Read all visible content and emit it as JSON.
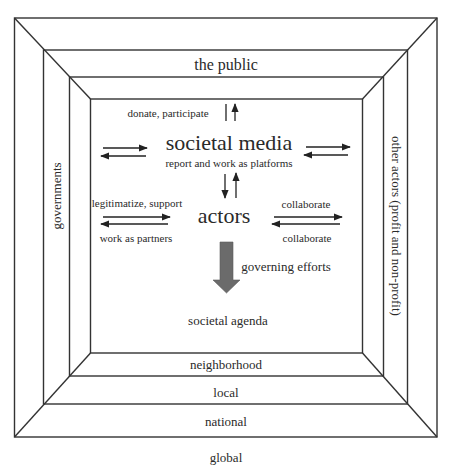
{
  "diagram": {
    "type": "nested-frames",
    "colors": {
      "line": "#333333",
      "arrow": "#222222",
      "big_arrow": "#6b6b6b",
      "text": "#2a2a2a",
      "background": "#ffffff"
    },
    "layers": {
      "top": "the public",
      "left": "governments",
      "right": "other actors (profit and non-profit)",
      "bottom_levels": [
        "neighborhood",
        "local",
        "national",
        "global"
      ]
    },
    "center": {
      "societal_media": {
        "title": "societal media",
        "subtitle": "report and work as platforms",
        "top_label": "donate, participate"
      },
      "actors": {
        "title": "actors",
        "left_top_label": "legitimatize, support",
        "left_bottom_label": "work as partners",
        "right_top_label": "collaborate",
        "right_bottom_label": "collaborate"
      },
      "governing_label": "governing efforts",
      "outcome": "societal agenda"
    }
  }
}
